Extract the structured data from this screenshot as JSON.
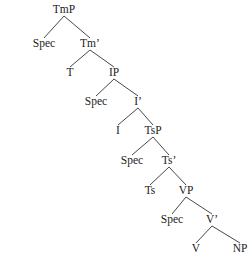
{
  "diagram": {
    "type": "syntax-tree",
    "nodes": [
      {
        "id": "TmP",
        "label": "TmP",
        "x": 64,
        "y": 10
      },
      {
        "id": "Spec1",
        "label": "Spec",
        "x": 44,
        "y": 44
      },
      {
        "id": "Tm_bar",
        "label": "Tm’",
        "x": 90,
        "y": 44
      },
      {
        "id": "T",
        "label": "T",
        "x": 70,
        "y": 73
      },
      {
        "id": "IP",
        "label": "IP",
        "x": 114,
        "y": 73
      },
      {
        "id": "Spec2",
        "label": "Spec",
        "x": 96,
        "y": 102
      },
      {
        "id": "I_bar",
        "label": "I’",
        "x": 138,
        "y": 102
      },
      {
        "id": "I",
        "label": "I",
        "x": 118,
        "y": 131
      },
      {
        "id": "TsP",
        "label": "TsP",
        "x": 153,
        "y": 131
      },
      {
        "id": "Spec3",
        "label": "Spec",
        "x": 132,
        "y": 161
      },
      {
        "id": "Ts_bar",
        "label": "Ts’",
        "x": 169,
        "y": 161
      },
      {
        "id": "Ts",
        "label": "Ts",
        "x": 150,
        "y": 191
      },
      {
        "id": "VP",
        "label": "VP",
        "x": 186,
        "y": 191
      },
      {
        "id": "Spec4",
        "label": "Spec",
        "x": 172,
        "y": 220
      },
      {
        "id": "V_bar",
        "label": "V’",
        "x": 212,
        "y": 220
      },
      {
        "id": "V",
        "label": "V",
        "x": 196,
        "y": 249
      },
      {
        "id": "NP",
        "label": "NP",
        "x": 240,
        "y": 249
      }
    ],
    "edges": [
      [
        "TmP",
        "Spec1"
      ],
      [
        "TmP",
        "Tm_bar"
      ],
      [
        "Tm_bar",
        "T"
      ],
      [
        "Tm_bar",
        "IP"
      ],
      [
        "IP",
        "Spec2"
      ],
      [
        "IP",
        "I_bar"
      ],
      [
        "I_bar",
        "I"
      ],
      [
        "I_bar",
        "TsP"
      ],
      [
        "TsP",
        "Spec3"
      ],
      [
        "TsP",
        "Ts_bar"
      ],
      [
        "Ts_bar",
        "Ts"
      ],
      [
        "Ts_bar",
        "VP"
      ],
      [
        "VP",
        "Spec4"
      ],
      [
        "VP",
        "V_bar"
      ],
      [
        "V_bar",
        "V"
      ],
      [
        "V_bar",
        "NP"
      ]
    ]
  }
}
